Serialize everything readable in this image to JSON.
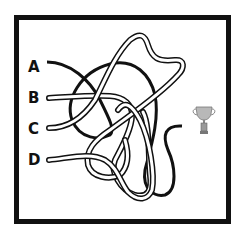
{
  "puzzle": {
    "type": "tangled-lines maze",
    "goal_icon": "trophy-icon",
    "start_labels": [
      "A",
      "B",
      "C",
      "D"
    ]
  },
  "labels": {
    "a": "A",
    "b": "B",
    "c": "C",
    "d": "D"
  },
  "colors": {
    "frame": "#111111",
    "line_solid": "#111111",
    "line_hollow_outline": "#111111",
    "line_hollow_fill": "#ffffff",
    "trophy": "#9a9a9a",
    "background": "#ffffff"
  }
}
